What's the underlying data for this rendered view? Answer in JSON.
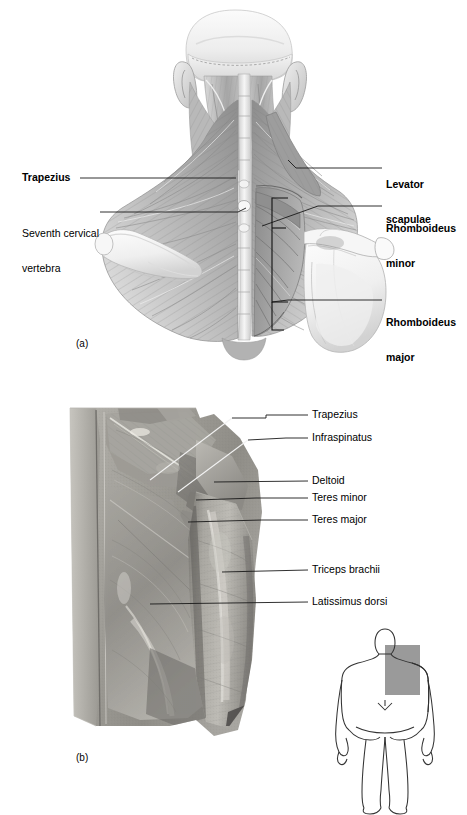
{
  "figure": {
    "type": "anatomical-figure",
    "panels": [
      {
        "id": "panel-a",
        "id_label": "(a)",
        "kind": "illustration",
        "view": "posterior view of neck, shoulders and upper back",
        "labels": [
          {
            "name": "trapezius",
            "text": "Trapezius",
            "bold": true,
            "side": "left",
            "lines": [
              "Trapezius"
            ]
          },
          {
            "name": "seventh-cervical-vertebra",
            "text": "Seventh cervical vertebra",
            "bold": false,
            "side": "left",
            "lines": [
              "Seventh cervical",
              "vertebra"
            ]
          },
          {
            "name": "levator-scapulae",
            "text": "Levator scapulae",
            "bold": true,
            "side": "right",
            "lines": [
              "Levator",
              "scapulae"
            ]
          },
          {
            "name": "rhomboideus-minor",
            "text": "Rhomboideus minor",
            "bold": true,
            "side": "right",
            "lines": [
              "Rhomboideus",
              "minor"
            ]
          },
          {
            "name": "rhomboideus-major",
            "text": "Rhomboideus major",
            "bold": true,
            "side": "right",
            "lines": [
              "Rhomboideus",
              "major"
            ]
          }
        ]
      },
      {
        "id": "panel-b",
        "id_label": "(b)",
        "kind": "cadaver-photograph",
        "view": "posterior view of right shoulder, back and arm",
        "labels": [
          {
            "name": "trapezius",
            "text": "Trapezius",
            "bold": false
          },
          {
            "name": "infraspinatus",
            "text": "Infraspinatus",
            "bold": false
          },
          {
            "name": "deltoid",
            "text": "Deltoid",
            "bold": false
          },
          {
            "name": "teres-minor",
            "text": "Teres minor",
            "bold": false
          },
          {
            "name": "teres-major",
            "text": "Teres major",
            "bold": false
          },
          {
            "name": "triceps-brachii",
            "text": "Triceps brachii",
            "bold": false
          },
          {
            "name": "latissimus-dorsi",
            "text": "Latissimus dorsi",
            "bold": false
          }
        ],
        "orientation_diagram": {
          "name": "body-orientation-diagram",
          "view": "posterior whole-body silhouette",
          "highlight_region": "right upper back and shoulder",
          "highlight_color": "#9a9a9a",
          "outline_color": "#333333"
        }
      }
    ]
  },
  "colors": {
    "leader_line": "#1a1a1a",
    "leader_line_light": "#f2f2f2",
    "text": "#000000",
    "background": "#ffffff",
    "illustration_mid": "#b9b9b9",
    "illustration_dark": "#6e6e6e",
    "photo_mid": "#9d9c97"
  }
}
